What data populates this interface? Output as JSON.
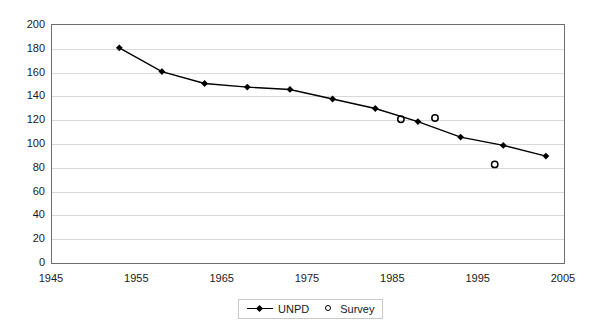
{
  "chart_data": {
    "type": "line",
    "title": "",
    "xlabel": "",
    "ylabel": "",
    "xlim": [
      1945,
      2005
    ],
    "ylim": [
      0,
      200
    ],
    "grid": true,
    "legend_position": "bottom",
    "x_ticks": [
      1945,
      1955,
      1965,
      1975,
      1985,
      1995,
      2005
    ],
    "y_ticks": [
      0,
      20,
      40,
      60,
      80,
      100,
      120,
      140,
      160,
      180,
      200
    ],
    "series": [
      {
        "name": "UNPD",
        "marker": "diamond",
        "style": "line-with-markers",
        "color": "#000000",
        "points": [
          {
            "x": 1953,
            "y": 180
          },
          {
            "x": 1958,
            "y": 160
          },
          {
            "x": 1963,
            "y": 150
          },
          {
            "x": 1968,
            "y": 147
          },
          {
            "x": 1973,
            "y": 145
          },
          {
            "x": 1978,
            "y": 137
          },
          {
            "x": 1983,
            "y": 129
          },
          {
            "x": 1988,
            "y": 118
          },
          {
            "x": 1993,
            "y": 105
          },
          {
            "x": 1998,
            "y": 98
          },
          {
            "x": 2003,
            "y": 89
          }
        ]
      },
      {
        "name": "Survey",
        "marker": "open-circle",
        "style": "markers-only",
        "color": "#000000",
        "points": [
          {
            "x": 1986,
            "y": 120
          },
          {
            "x": 1990,
            "y": 121
          },
          {
            "x": 1997,
            "y": 82
          }
        ]
      }
    ]
  },
  "legend": {
    "items": [
      {
        "label": "UNPD"
      },
      {
        "label": "Survey"
      }
    ]
  }
}
